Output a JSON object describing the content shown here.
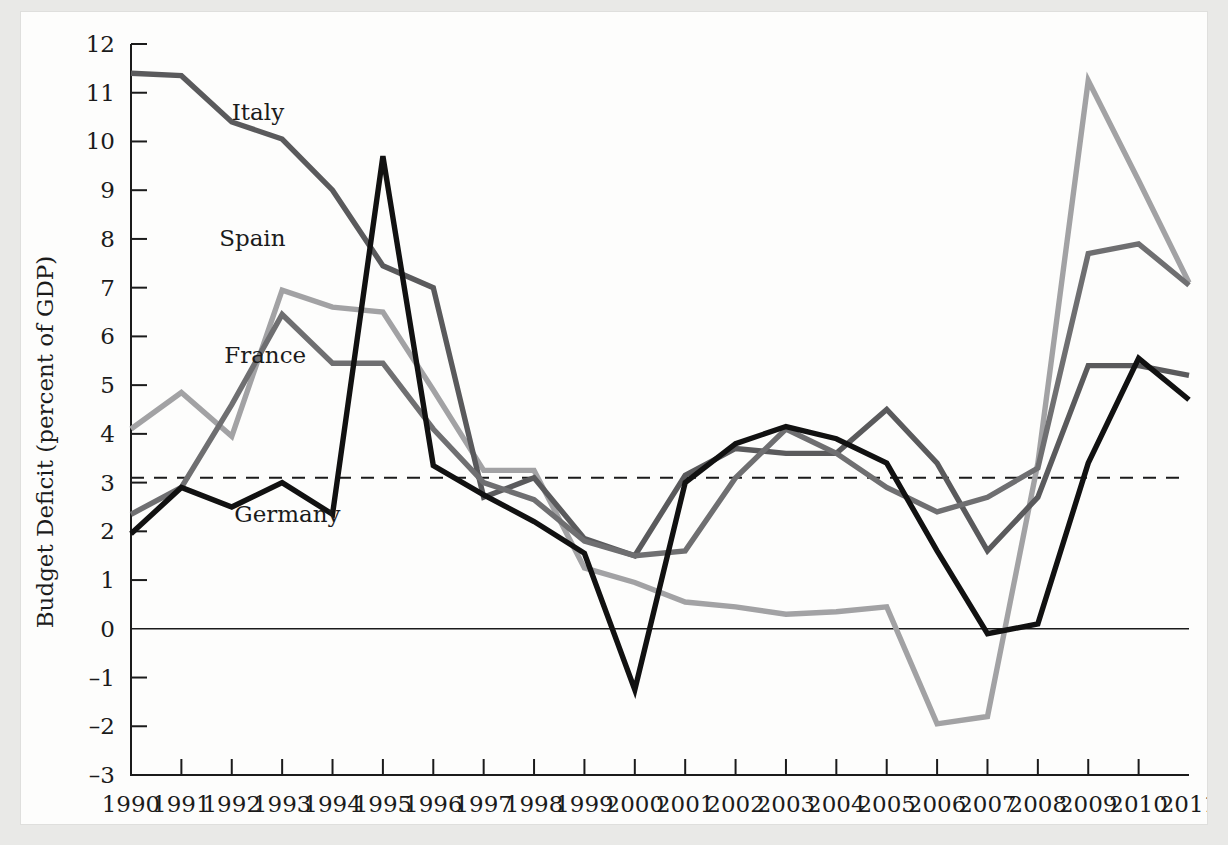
{
  "chart_data": {
    "type": "line",
    "title": "",
    "xlabel": "",
    "ylabel": "Budget Deficit (percent of GDP)",
    "xlim": [
      1990,
      2011
    ],
    "ylim": [
      -3,
      12
    ],
    "grid": false,
    "legend_position": "inline-labels",
    "categories": [
      1990,
      1991,
      1992,
      1993,
      1994,
      1995,
      1996,
      1997,
      1998,
      1999,
      2000,
      2001,
      2002,
      2003,
      2004,
      2005,
      2006,
      2007,
      2008,
      2009,
      2010,
      2011
    ],
    "x_tick_labels": [
      "1990",
      "1991",
      "1992",
      "1993",
      "1994",
      "1995",
      "1996",
      "1997",
      "1998",
      "1999",
      "2000",
      "2001",
      "2002",
      "2003",
      "2004",
      "2005",
      "2006",
      "2007",
      "2008",
      "2009",
      "2010",
      "2011"
    ],
    "y_tick_labels": [
      "12",
      "11",
      "10",
      "9",
      "8",
      "7",
      "6",
      "5",
      "4",
      "3",
      "2",
      "1",
      "0",
      "–1",
      "–2",
      "–3"
    ],
    "y_ticks": [
      12,
      11,
      10,
      9,
      8,
      7,
      6,
      5,
      4,
      3,
      2,
      1,
      0,
      -1,
      -2,
      -3
    ],
    "reference_line": {
      "label": "3 percent reference",
      "value": 3.1,
      "style": "dashed"
    },
    "zero_line": {
      "value": 0,
      "style": "solid"
    },
    "series": [
      {
        "name": "Italy",
        "color": "#5a5a5c",
        "label_x": 1992.0,
        "label_y": 10.45,
        "values": [
          11.4,
          11.35,
          10.4,
          10.05,
          9.0,
          7.45,
          7.0,
          2.7,
          3.1,
          1.85,
          1.5,
          3.15,
          3.7,
          3.6,
          3.6,
          4.5,
          3.4,
          1.6,
          2.7,
          5.4,
          5.4,
          5.2
        ]
      },
      {
        "name": "Spain",
        "color": "#a2a2a4",
        "label_x": 1991.75,
        "label_y": 7.85,
        "values": [
          4.1,
          4.85,
          3.95,
          6.95,
          6.6,
          6.5,
          4.9,
          3.25,
          3.25,
          1.25,
          0.95,
          0.55,
          0.45,
          0.3,
          0.35,
          0.45,
          -1.95,
          -1.8,
          3.4,
          11.25,
          9.2,
          7.1
        ]
      },
      {
        "name": "France",
        "color": "#6f6f71",
        "label_x": 1991.85,
        "label_y": 5.45,
        "values": [
          2.35,
          2.9,
          4.6,
          6.45,
          5.45,
          5.45,
          4.1,
          3.0,
          2.65,
          1.8,
          1.5,
          1.6,
          3.1,
          4.1,
          3.6,
          2.9,
          2.4,
          2.7,
          3.3,
          7.7,
          7.9,
          7.05
        ]
      },
      {
        "name": "Germany",
        "color": "#111111",
        "label_x": 1992.05,
        "label_y": 2.2,
        "values": [
          1.95,
          2.9,
          2.5,
          3.0,
          2.35,
          9.7,
          3.35,
          2.75,
          2.2,
          1.55,
          -1.25,
          3.0,
          3.8,
          4.15,
          3.9,
          3.4,
          1.6,
          -0.1,
          0.1,
          3.4,
          5.55,
          4.7
        ]
      }
    ]
  },
  "annotations": {
    "italy_label": "Italy",
    "spain_label": "Spain",
    "france_label": "France",
    "germany_label": "Germany"
  }
}
